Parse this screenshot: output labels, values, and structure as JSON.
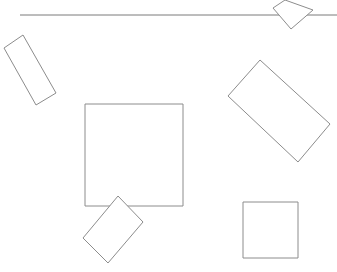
{
  "header": {
    "title_clipped": "— — — — — — — —"
  },
  "colors": {
    "background": "#ffffff",
    "stroke": "#8c8c8c",
    "line": "#7a7a7a"
  },
  "divider": {
    "x1": 20,
    "y1": 15,
    "x2": 337,
    "y2": 15
  },
  "shapes": [
    {
      "name": "top-right-diamond",
      "points": "285,0 313,10 291,29 273,8"
    },
    {
      "name": "left-tilted-rect",
      "points": "23,35 56,93 36,105 4,48"
    },
    {
      "name": "right-tilted-rect",
      "points": "260,60 330,124 298,162 228,96"
    },
    {
      "name": "center-square",
      "points": "85,104 183,104 183,206 85,206"
    },
    {
      "name": "bottom-tilted-rect",
      "points": "118,196 143,222 108,263 83,238"
    },
    {
      "name": "bottom-right-square",
      "points": "243,202 298,202 298,258 243,258"
    }
  ]
}
